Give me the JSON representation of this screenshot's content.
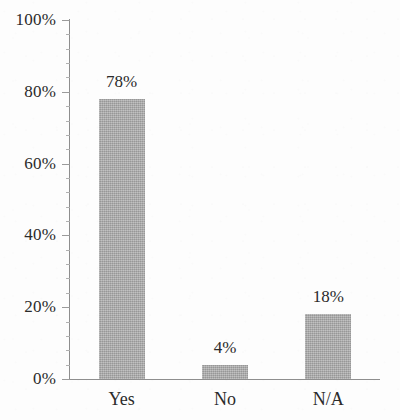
{
  "chart_data": {
    "type": "bar",
    "title": "",
    "subtitle": "",
    "xlabel": "",
    "ylabel": "",
    "categories": [
      "Yes",
      "No",
      "N/A"
    ],
    "values": [
      78,
      4,
      18
    ],
    "value_labels": [
      "78%",
      "4%",
      "18%"
    ],
    "ylim": [
      0,
      100
    ],
    "ytick_values": [
      0,
      20,
      40,
      60,
      80,
      100
    ],
    "ytick_labels": [
      "0%",
      "20%",
      "40%",
      "60%",
      "80%",
      "100%"
    ],
    "yminor_tick_step": 4,
    "grid": false,
    "legend": null,
    "legend_position": "none",
    "orientation": "vertical",
    "series": [
      {
        "name": "Responses",
        "values": [
          78,
          4,
          18
        ]
      }
    ],
    "colors": {
      "bar_fill": "#a9a9a9",
      "axis": "#8e8e8e",
      "text": "#2b2b2b",
      "background": "#fdfdfd"
    }
  }
}
